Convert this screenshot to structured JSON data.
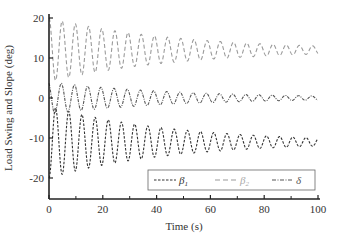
{
  "chart_data": {
    "type": "line",
    "title": "",
    "xlabel": "Time (s)",
    "ylabel": "Load Swing and Slope (deg)",
    "xlim": [
      0,
      100
    ],
    "ylim": [
      -25,
      21
    ],
    "xticks": [
      0,
      20,
      40,
      60,
      80,
      100
    ],
    "xticks_minor": [
      10,
      30,
      50,
      70,
      90
    ],
    "yticks": [
      -20,
      -10,
      0,
      10,
      20
    ],
    "grid": false,
    "legend_position": "lower right (inside)",
    "series": [
      {
        "name": "β1",
        "label_base": "β",
        "label_sub": "1",
        "style": "dashed",
        "color": "#333333",
        "center": -11,
        "initial_amplitude": 9,
        "final_amplitude": 1,
        "period_s": 4.9,
        "description": "damped oscillation around -11 deg; peaks ~ -3 to -20 initially, settles near -11 by 100 s"
      },
      {
        "name": "β2",
        "label_base": "β",
        "label_sub": "2",
        "style": "long-dash",
        "color": "#9a9a9a",
        "center": 12,
        "initial_amplitude": 8,
        "final_amplitude": 1,
        "period_s": 4.9,
        "description": "damped oscillation around 12 deg; peaks ~ 20 to 4 initially, settles near 12 by 100 s"
      },
      {
        "name": "δ",
        "label_base": "δ",
        "label_sub": "",
        "style": "dash-dot",
        "color": "#555555",
        "center": 0,
        "initial_amplitude": 4,
        "final_amplitude": 0.5,
        "period_s": 4.9,
        "description": "damped oscillation around 0 deg; peaks ~ ±4 initially, settles near 0 by 100 s"
      }
    ],
    "sampled_points": {
      "x": [
        0,
        10,
        20,
        30,
        40,
        50,
        60,
        70,
        80,
        90,
        100
      ],
      "beta1_envelope": [
        9,
        7.2,
        5.8,
        4.6,
        3.7,
        3.0,
        2.4,
        1.9,
        1.5,
        1.2,
        1.0
      ],
      "beta2_envelope": [
        8,
        6.2,
        4.8,
        3.7,
        2.9,
        2.3,
        1.8,
        1.5,
        1.2,
        1.0,
        0.9
      ],
      "delta_envelope": [
        4,
        3.0,
        2.3,
        1.8,
        1.4,
        1.1,
        0.9,
        0.7,
        0.6,
        0.5,
        0.5
      ]
    }
  }
}
